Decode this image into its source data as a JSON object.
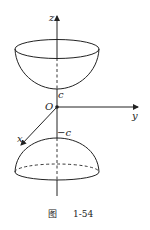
{
  "figure": {
    "caption_prefix": "图",
    "caption_number": "1-54",
    "axes": {
      "z_label": "z",
      "y_label": "y",
      "x_label": "x",
      "origin_label": "O"
    },
    "upper_sheet": {
      "vertex_label": "c"
    },
    "lower_sheet": {
      "vertex_label": "−c"
    },
    "colors": {
      "stroke": "#222222",
      "background": "#ffffff"
    }
  }
}
